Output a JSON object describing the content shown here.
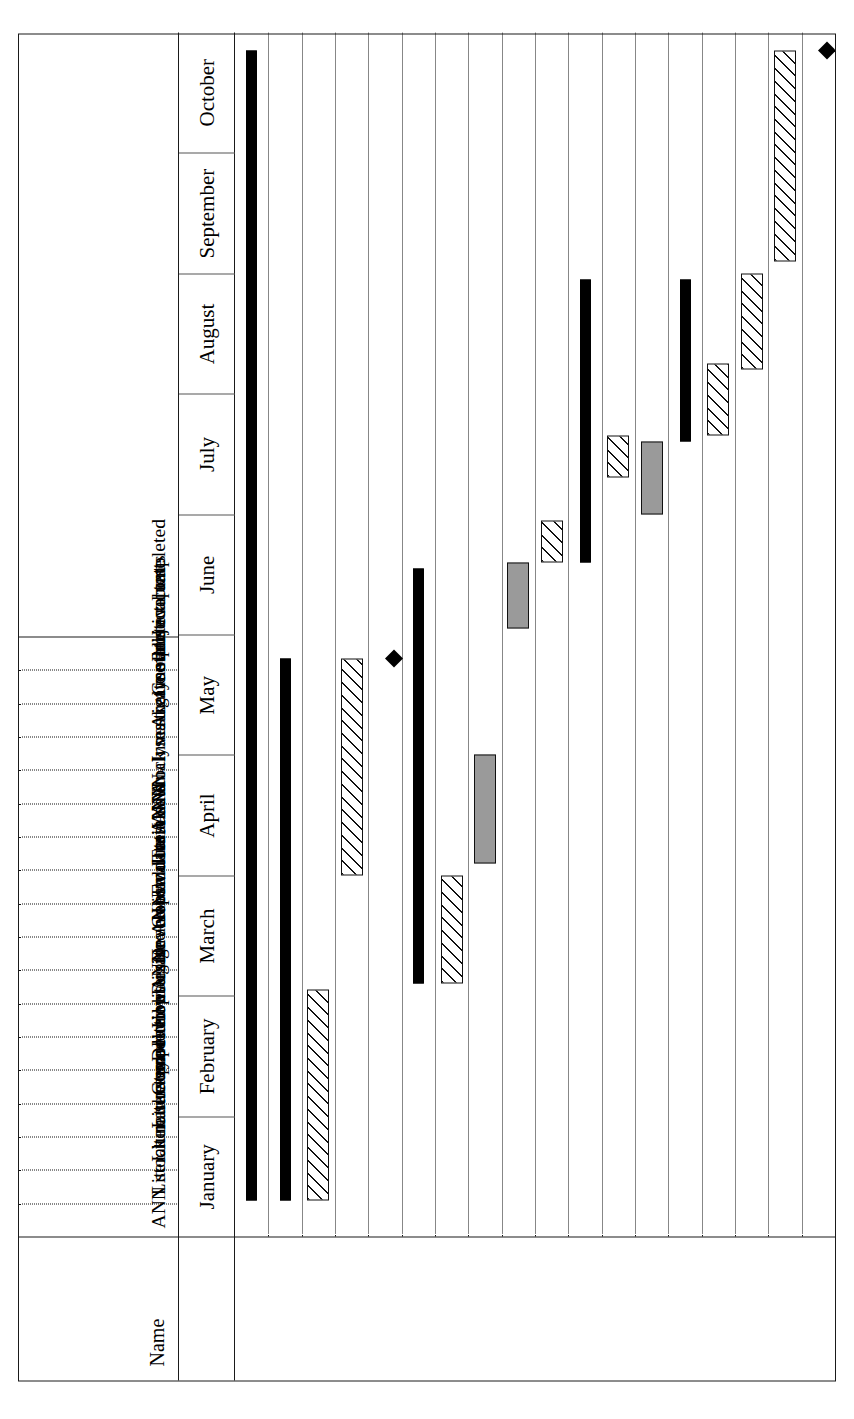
{
  "chart_data": {
    "type": "gantt",
    "title": "",
    "name_header": "Name",
    "timeline_start": "January",
    "timeline_end": "October",
    "months": [
      "January",
      "February",
      "March",
      "April",
      "May",
      "June",
      "July",
      "August",
      "September",
      "October"
    ],
    "axis": {
      "grid": true,
      "grid_style": "dotted",
      "unit": "month",
      "count": 10
    },
    "legend_position": "none",
    "bar_styles": {
      "summary": "solid-black-with-arrow-caps",
      "task": "white-with-diagonal-hatch",
      "task_filled": "solid-grey",
      "milestone": "black-diamond"
    },
    "colors": {
      "summary_fill": "#000000",
      "hatch_line": "#111111",
      "grey_fill": "#9a9a9a",
      "bar_border": "#111111",
      "grid_line": "#111111",
      "frame": "#1a1a1a",
      "background": "#ffffff"
    },
    "tasks": [
      {
        "id": 1,
        "name": "ANN stock market prediction",
        "type": "summary",
        "start_month": 0.3,
        "end_month": 9.85,
        "duration_months": 9.55
      },
      {
        "id": 2,
        "name": "Literature survey",
        "type": "summary",
        "start_month": 0.3,
        "end_month": 4.8,
        "duration_months": 4.5
      },
      {
        "id": 3,
        "name": "Literature search",
        "type": "task",
        "start_month": 0.3,
        "end_month": 2.05,
        "duration_months": 1.75
      },
      {
        "id": 4,
        "name": "Literature review",
        "type": "task",
        "start_month": 3.0,
        "end_month": 4.8,
        "duration_months": 1.8
      },
      {
        "id": 5,
        "name": "Completed literature review",
        "type": "milestone",
        "start_month": 4.8,
        "end_month": 4.8,
        "duration_months": 0
      },
      {
        "id": 6,
        "name": "Develop ANN",
        "type": "summary",
        "start_month": 2.1,
        "end_month": 5.55,
        "duration_months": 3.45
      },
      {
        "id": 7,
        "name": "Investigate and evaluate ANNs",
        "type": "task",
        "start_month": 2.1,
        "end_month": 3.0,
        "duration_months": 0.9
      },
      {
        "id": 8,
        "name": "Design ANN",
        "type": "task_filled",
        "start_month": 3.1,
        "end_month": 4.0,
        "duration_months": 0.9
      },
      {
        "id": 9,
        "name": "Develop and test ANN",
        "type": "task_filled",
        "start_month": 5.05,
        "end_month": 5.6,
        "duration_months": 0.55
      },
      {
        "id": 10,
        "name": "Get stock test data",
        "type": "task",
        "start_month": 5.6,
        "end_month": 5.95,
        "duration_months": 0.35
      },
      {
        "id": 11,
        "name": "Evaluation",
        "type": "summary",
        "start_month": 5.6,
        "end_month": 7.95,
        "duration_months": 2.35
      },
      {
        "id": 12,
        "name": "Train ANN",
        "type": "task",
        "start_month": 6.3,
        "end_month": 6.65,
        "duration_months": 0.35
      },
      {
        "id": 13,
        "name": "Use stock market models",
        "type": "task_filled",
        "start_month": 6.0,
        "end_month": 6.6,
        "duration_months": 0.6
      },
      {
        "id": 14,
        "name": "Analyses",
        "type": "summary",
        "start_month": 6.6,
        "end_month": 7.95,
        "duration_months": 1.35
      },
      {
        "id": 15,
        "name": "Investigate statistical tests",
        "type": "task",
        "start_month": 6.65,
        "end_month": 7.25,
        "duration_months": 0.6
      },
      {
        "id": 16,
        "name": "Analyse and evaluate",
        "type": "task",
        "start_month": 7.2,
        "end_month": 8.0,
        "duration_months": 0.8
      },
      {
        "id": 17,
        "name": "Complete report",
        "type": "task",
        "start_month": 8.1,
        "end_month": 9.85,
        "duration_months": 1.75
      },
      {
        "id": 18,
        "name": "Project completed",
        "type": "milestone",
        "start_month": 9.85,
        "end_month": 9.85,
        "duration_months": 0
      }
    ]
  },
  "header": {
    "name_column_label": "Name"
  },
  "months": [
    {
      "label": "January"
    },
    {
      "label": "February"
    },
    {
      "label": "March"
    },
    {
      "label": "April"
    },
    {
      "label": "May"
    },
    {
      "label": "June"
    },
    {
      "label": "July"
    },
    {
      "label": "August"
    },
    {
      "label": "September"
    },
    {
      "label": "October"
    }
  ],
  "rows": [
    {
      "label": "ANN stock market prediction"
    },
    {
      "label": "Literature survey"
    },
    {
      "label": "Literature search"
    },
    {
      "label": "Literature review"
    },
    {
      "label": "Completed literature review"
    },
    {
      "label": "Develop ANN"
    },
    {
      "label": "Investigate and evaluate ANNs"
    },
    {
      "label": "Design ANN"
    },
    {
      "label": "Develop and test ANN"
    },
    {
      "label": "Get stock test data"
    },
    {
      "label": "Evaluation"
    },
    {
      "label": "Train ANN"
    },
    {
      "label": "Use stock market models"
    },
    {
      "label": "Analyses"
    },
    {
      "label": "Investigate statistical tests"
    },
    {
      "label": "Analyse and evaluate"
    },
    {
      "label": "Complete report"
    },
    {
      "label": "Project completed"
    }
  ]
}
